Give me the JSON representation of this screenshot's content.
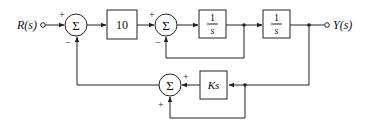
{
  "diagram": {
    "type": "block-diagram",
    "input_label": "R(s)",
    "output_label": "Y(s)",
    "summing_junction_symbol": "Σ",
    "summing_junctions": [
      {
        "id": "sum1",
        "inputs": [
          {
            "from": "R(s)",
            "sign": "+"
          },
          {
            "from": "sum3",
            "sign": "−"
          }
        ]
      },
      {
        "id": "sum2",
        "inputs": [
          {
            "from": "gain10",
            "sign": "+"
          },
          {
            "from": "integrator1_out",
            "sign": "−"
          }
        ]
      },
      {
        "id": "sum3",
        "inputs": [
          {
            "from": "Ks",
            "sign": "+"
          },
          {
            "from": "Y(s)",
            "sign": "+"
          }
        ]
      }
    ],
    "blocks": [
      {
        "id": "gain10",
        "label": "10"
      },
      {
        "id": "integrator1",
        "numerator": "1",
        "denominator": "s"
      },
      {
        "id": "integrator2",
        "numerator": "1",
        "denominator": "s"
      },
      {
        "id": "Ks",
        "label": "Ks"
      }
    ],
    "signs": {
      "sum1_top": "+",
      "sum1_bottom": "−",
      "sum2_top": "+",
      "sum2_bottom": "−",
      "sum3_right": "+",
      "sum3_bottom": "+"
    }
  }
}
